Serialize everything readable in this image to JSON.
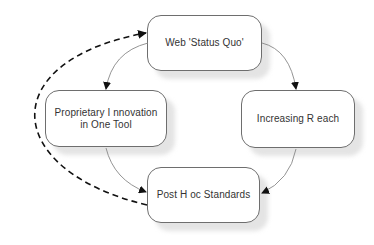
{
  "diagram": {
    "nodes": [
      {
        "id": "status_quo",
        "label_lines": [
          "Web 'Status Quo'"
        ]
      },
      {
        "id": "proprietary",
        "label_lines": [
          "Proprietary I nnovation",
          "in One Tool"
        ]
      },
      {
        "id": "reach",
        "label_lines": [
          "Increasing R each"
        ]
      },
      {
        "id": "standards",
        "label_lines": [
          "Post H oc Standards"
        ]
      }
    ],
    "edges": [
      {
        "from": "status_quo",
        "to": "proprietary",
        "style": "solid"
      },
      {
        "from": "status_quo",
        "to": "reach",
        "style": "solid"
      },
      {
        "from": "proprietary",
        "to": "standards",
        "style": "solid"
      },
      {
        "from": "reach",
        "to": "standards",
        "style": "solid"
      },
      {
        "from": "standards",
        "to": "status_quo",
        "style": "dashed"
      }
    ],
    "colors": {
      "node_border": "#6e6e6e",
      "node_fill": "#ffffff",
      "shadow": "#e4e4e4",
      "text": "#333333",
      "solid_edge": "#888888",
      "dashed_edge": "#111111"
    }
  }
}
